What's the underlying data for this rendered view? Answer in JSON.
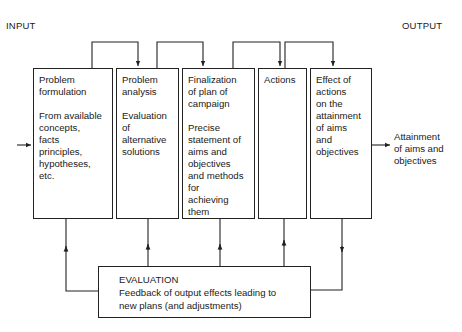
{
  "labels": {
    "input": "INPUT",
    "output": "OUTPUT"
  },
  "stages": [
    {
      "id": "problem-formulation",
      "text": "Problem\nformulation\n\nFrom available\nconcepts,\nfacts\nprinciples,\nhypotheses,\netc."
    },
    {
      "id": "problem-analysis",
      "text": "Problem\nanalysis\n\nEvaluation\nof\nalternative\nsolutions"
    },
    {
      "id": "finalization",
      "text": "Finalization\nof plan of\ncampaign\n\nPrecise\nstatement of\naims and\nobjectives\nand methods\nfor\nachieving\nthem"
    },
    {
      "id": "actions",
      "text": "Actions"
    },
    {
      "id": "effect-of-actions",
      "text": "Effect of\nactions\non the\nattainment\nof aims\nand\nobjectives"
    }
  ],
  "output_result": "Attainment\nof aims and\nobjectives",
  "evaluation": {
    "title": "EVALUATION",
    "text": "EVALUATION\nFeedback of output effects leading to\nnew plans (and  adjustments)"
  },
  "colors": {
    "line": "#222222",
    "background": "#ffffff"
  }
}
